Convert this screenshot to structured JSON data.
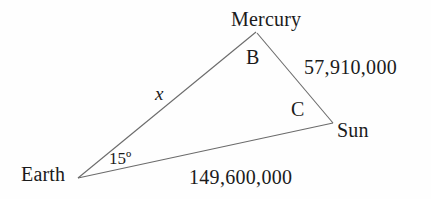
{
  "diagram": {
    "type": "triangle",
    "stroke_color": "#6b6b6b",
    "text_color": "#1b1b1b",
    "background_color": "#fefefe",
    "vertices": [
      {
        "id": "mercury",
        "label": "Mercury",
        "x": 256,
        "y": 32
      },
      {
        "id": "sun",
        "label": "Sun",
        "x": 333,
        "y": 123
      },
      {
        "id": "earth",
        "label": "Earth",
        "x": 78,
        "y": 178
      }
    ],
    "angles": [
      {
        "id": "angle-b",
        "label": "B",
        "at_vertex": "mercury",
        "x": 252,
        "y": 57
      },
      {
        "id": "angle-c",
        "label": "C",
        "at_vertex": "sun",
        "x": 297,
        "y": 109
      },
      {
        "id": "angle-earth",
        "label": "15º",
        "at_vertex": "earth",
        "x": 124,
        "y": 159
      }
    ],
    "sides": [
      {
        "id": "side-earth-mercury",
        "label": "x",
        "from": "earth",
        "to": "mercury",
        "x": 161,
        "y": 93,
        "style": "italic"
      },
      {
        "id": "side-mercury-sun",
        "label": "57,910,000",
        "from": "mercury",
        "to": "sun",
        "x": 362,
        "y": 67,
        "style": "normal"
      },
      {
        "id": "side-earth-sun",
        "label": "149,600,000",
        "from": "earth",
        "to": "sun",
        "x": 245,
        "y": 177,
        "style": "normal"
      }
    ]
  }
}
